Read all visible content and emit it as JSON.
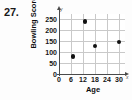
{
  "problem": {
    "number": "27."
  },
  "chart_data": {
    "type": "scatter",
    "title": "",
    "xlabel": "Age",
    "ylabel": "Bowling Score",
    "x_axis_letter": "x",
    "y_axis_letter": "y",
    "xlim": [
      0,
      33
    ],
    "ylim": [
      0,
      275
    ],
    "xticks": [
      0,
      6,
      12,
      18,
      24,
      30
    ],
    "xtick_labels": [
      "0",
      "6",
      "12",
      "18",
      "24",
      "30"
    ],
    "yticks": [
      0,
      50,
      100,
      150,
      200,
      250
    ],
    "ytick_labels": [
      "0",
      "50",
      "100",
      "150",
      "200",
      "250"
    ],
    "grid": true,
    "legend": false,
    "marker": "filled-circle",
    "marker_color": "#111111",
    "grid_color": "#c9c9c9",
    "axis_color": "#4a4a4a",
    "points": [
      {
        "x": 7,
        "y": 80
      },
      {
        "x": 13,
        "y": 240
      },
      {
        "x": 18,
        "y": 128
      },
      {
        "x": 30,
        "y": 147
      }
    ]
  }
}
